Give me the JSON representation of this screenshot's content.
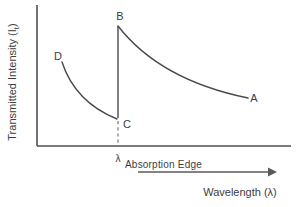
{
  "diagram": {
    "y_axis_label": {
      "prefix": "Transmitted Intensity (I",
      "subscript": "t",
      "suffix": ")"
    },
    "x_axis_label": "Wavelength (λ)",
    "point_labels": {
      "A": "A",
      "B": "B",
      "C": "C",
      "D": "D"
    },
    "lambda_label": "λ",
    "absorption_edge_label": "Absorption Edge"
  },
  "colors": {
    "background": "#ffffff",
    "line": "#4a4a4a",
    "axis": "#4f4f4f",
    "text": "#3d3d3d",
    "dashed": "#6b6b6b"
  },
  "geometry": {
    "y_axis_path": "M 37 5 L 37 146",
    "x_axis_path": "M 37 146 L 291 146",
    "curve_d_to_c_path": "M 62 62 Q 75 102 117 119",
    "edge_b_to_c_path": "M 118 26 L 118 118",
    "curve_b_to_a_path": "M 118 26 Q 160 80 248 98",
    "dashed_lambda_path": "M 118 121 L 118 146",
    "wavelength_arrow_path": "M 138 172 L 268 172",
    "wavelength_arrowhead_points": "268,167.5 277,172 268,176.5"
  },
  "chart_data": {
    "type": "line",
    "xlabel": "Wavelength (λ)",
    "ylabel": "Transmitted Intensity (It)",
    "labeled_points": [
      "D",
      "C",
      "B",
      "A"
    ],
    "annotations": [
      "λ Absorption Edge"
    ]
  }
}
